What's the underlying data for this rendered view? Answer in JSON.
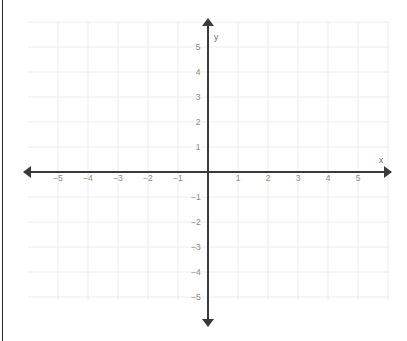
{
  "figure": {
    "type": "coordinate-plane",
    "width": 407,
    "height": 341,
    "background_color": "#ffffff",
    "grid_color": "#ececec",
    "axis_color": "#3a3a3a",
    "label_color": "#8a8a8a",
    "axis_name_color": "#6f6f6f",
    "border_color": "#2b2b2b"
  },
  "chart_data": {
    "type": "scatter",
    "title": "",
    "subtitle": "",
    "xlabel": "x",
    "ylabel": "y",
    "xlim": [
      -5.9,
      5.9
    ],
    "ylim": [
      -6.0,
      6.0
    ],
    "grid": true,
    "legend": null,
    "series": [],
    "x": [],
    "y": [],
    "annotations": [],
    "x_ticks": [
      -5,
      -4,
      -3,
      -2,
      -1,
      1,
      2,
      3,
      4,
      5
    ],
    "y_ticks": [
      5,
      4,
      3,
      2,
      1,
      -1,
      -2,
      -3,
      -4,
      -5
    ],
    "x_tick_labels": [
      "−5",
      "−4",
      "−3",
      "−2",
      "−1",
      "1",
      "2",
      "3",
      "4",
      "5"
    ],
    "y_tick_labels": [
      "5",
      "4",
      "3",
      "2",
      "1",
      "−1",
      "−2",
      "−3",
      "−4",
      "−5"
    ],
    "origin_px": [
      208,
      172
    ],
    "unit_px": [
      30,
      25
    ]
  },
  "axes": {
    "x_axis_label": "x",
    "y_axis_label": "y",
    "x_axis_label_pos": [
      379,
      156
    ],
    "y_axis_label_pos": [
      214,
      33
    ]
  },
  "x_tick_labels": [
    {
      "text": "−5",
      "x": 58,
      "y": 178
    },
    {
      "text": "−4",
      "x": 88,
      "y": 178
    },
    {
      "text": "−3",
      "x": 118,
      "y": 178
    },
    {
      "text": "−2",
      "x": 148,
      "y": 178
    },
    {
      "text": "−1",
      "x": 178,
      "y": 178
    },
    {
      "text": "1",
      "x": 238,
      "y": 178
    },
    {
      "text": "2",
      "x": 268,
      "y": 178
    },
    {
      "text": "3",
      "x": 298,
      "y": 178
    },
    {
      "text": "4",
      "x": 328,
      "y": 178
    },
    {
      "text": "5",
      "x": 358,
      "y": 178
    }
  ],
  "y_tick_labels": [
    {
      "text": "5",
      "x": 198,
      "y": 47
    },
    {
      "text": "4",
      "x": 198,
      "y": 72
    },
    {
      "text": "3",
      "x": 198,
      "y": 97
    },
    {
      "text": "2",
      "x": 198,
      "y": 122
    },
    {
      "text": "1",
      "x": 198,
      "y": 147
    },
    {
      "text": "−1",
      "x": 196,
      "y": 197
    },
    {
      "text": "−2",
      "x": 196,
      "y": 222
    },
    {
      "text": "−3",
      "x": 196,
      "y": 247
    },
    {
      "text": "−4",
      "x": 196,
      "y": 272
    },
    {
      "text": "−5",
      "x": 196,
      "y": 297
    }
  ],
  "grid_lines": {
    "vertical_x": [
      58,
      88,
      118,
      148,
      178,
      208,
      238,
      268,
      298,
      328,
      358,
      388
    ],
    "horizontal_y": [
      22,
      47,
      72,
      97,
      122,
      147,
      172,
      197,
      222,
      247,
      272,
      297
    ],
    "v_top": 22,
    "v_bottom": 300,
    "h_left": 28,
    "h_right": 390
  },
  "axis_lines": {
    "x_start": 30,
    "x_end": 385,
    "x_y": 172,
    "y_start": 25,
    "y_end": 320,
    "y_x": 208,
    "stroke_width": 2,
    "arrow_size": 7
  }
}
